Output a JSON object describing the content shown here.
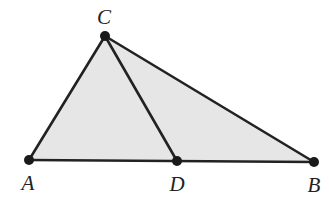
{
  "diagram": {
    "type": "geometry",
    "colors": {
      "fill": "#e6e6e6",
      "stroke": "#222222",
      "point": "#1a1a1a",
      "label": "#222222"
    },
    "points": [
      {
        "id": "A",
        "label": "A",
        "x": 29,
        "y": 160,
        "label_x": 28,
        "label_y": 183
      },
      {
        "id": "B",
        "label": "B",
        "x": 314,
        "y": 162,
        "label_x": 314,
        "label_y": 185
      },
      {
        "id": "C",
        "label": "C",
        "x": 105,
        "y": 36,
        "label_x": 104,
        "label_y": 17
      },
      {
        "id": "D",
        "label": "D",
        "x": 177,
        "y": 161,
        "label_x": 177,
        "label_y": 184
      }
    ],
    "polygons": [
      {
        "id": "triangle-ABC",
        "vertices": [
          "A",
          "B",
          "C"
        ],
        "filled": true
      }
    ],
    "segments": [
      {
        "from": "A",
        "to": "C"
      },
      {
        "from": "C",
        "to": "B"
      },
      {
        "from": "A",
        "to": "B"
      },
      {
        "from": "C",
        "to": "D"
      }
    ]
  }
}
